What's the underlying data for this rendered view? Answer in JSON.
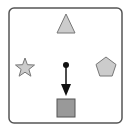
{
  "diagram": {
    "colors": {
      "background": "#ffffff",
      "border": "#555555",
      "shape_fill_light": "#cccccc",
      "shape_stroke": "#777777",
      "target_fill": "#999999",
      "arrow": "#111111"
    },
    "shapes": [
      {
        "name": "triangle",
        "position": "top"
      },
      {
        "name": "star",
        "position": "left"
      },
      {
        "name": "pentagon",
        "position": "right"
      },
      {
        "name": "square",
        "position": "bottom"
      }
    ],
    "arrow": {
      "from": "center",
      "direction": "down",
      "points_to": "square"
    }
  }
}
